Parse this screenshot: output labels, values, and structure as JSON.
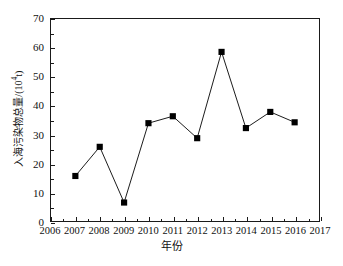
{
  "chart_data": {
    "type": "line",
    "title": "",
    "subtitle": "",
    "xlabel": "年份",
    "ylabel_prefix": "入海污染物总量/(10",
    "ylabel_sup": "4",
    "ylabel_suffix": "t)",
    "ylabel_full": "入海污染物总量/(10⁴t)",
    "x": [
      2007,
      2008,
      2009,
      2010,
      2011,
      2012,
      2013,
      2014,
      2015,
      2016
    ],
    "values": [
      15.6,
      25.7,
      6.4,
      33.9,
      36.3,
      28.7,
      58.6,
      32.2,
      37.8,
      34.2
    ],
    "categories": [
      "2007",
      "2008",
      "2009",
      "2010",
      "2011",
      "2012",
      "2013",
      "2014",
      "2015",
      "2016"
    ],
    "xlim": [
      2006,
      2017
    ],
    "ylim": [
      0,
      70
    ],
    "x_ticks": [
      2006,
      2007,
      2008,
      2009,
      2010,
      2011,
      2012,
      2013,
      2014,
      2015,
      2016,
      2017
    ],
    "x_tick_labels": [
      "2006",
      "2007",
      "2008",
      "2009",
      "2010",
      "2011",
      "2012",
      "2013",
      "2014",
      "2015",
      "2016",
      "2017"
    ],
    "y_ticks": [
      0,
      10,
      20,
      30,
      40,
      50,
      60,
      70
    ],
    "y_tick_labels": [
      "0",
      "10",
      "20",
      "30",
      "40",
      "50",
      "60",
      "70"
    ],
    "grid": false,
    "legend": null,
    "legend_position": "none",
    "marker": "square",
    "marker_color": "#000000",
    "line_color": "#000000",
    "series": [
      {
        "name": "入海污染物总量",
        "values": [
          15.6,
          25.7,
          6.4,
          33.9,
          36.3,
          28.7,
          58.6,
          32.2,
          37.8,
          34.2
        ]
      }
    ],
    "annotations": []
  }
}
